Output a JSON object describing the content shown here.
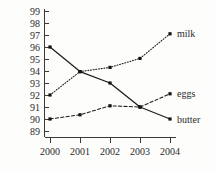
{
  "chart_data": {
    "type": "line",
    "title": "",
    "subtitle": "",
    "xlabel": "",
    "ylabel": "",
    "categories": [
      "2000",
      "2001",
      "2002",
      "2003",
      "2004"
    ],
    "x": [
      2000,
      2001,
      2002,
      2003,
      2004
    ],
    "ylim": [
      88.6,
      99.4
    ],
    "yticks": [
      89,
      90,
      91,
      92,
      93,
      94,
      95,
      96,
      97,
      98,
      99
    ],
    "ytick_labels": [
      "89",
      "90",
      "91",
      "92",
      "93",
      "94",
      "95",
      "96",
      "97",
      "98",
      "99"
    ],
    "xtick_labels": [
      "2000",
      "2001",
      "2002",
      "2003",
      "2004"
    ],
    "grid": false,
    "legend_position": "right-inline-end-of-line",
    "series": [
      {
        "name": "milk",
        "label": "milk",
        "linestyle": "dotted",
        "color": "#1c1c1c",
        "marker": "square",
        "values": [
          92.0,
          93.95,
          94.3,
          95.05,
          97.1
        ]
      },
      {
        "name": "eggs",
        "label": "eggs",
        "linestyle": "dashed",
        "color": "#1c1c1c",
        "marker": "square",
        "values": [
          90.0,
          90.35,
          91.1,
          91.0,
          92.1
        ]
      },
      {
        "name": "butter",
        "label": "butter",
        "linestyle": "solid",
        "color": "#1c1c1c",
        "marker": "square",
        "values": [
          96.0,
          93.95,
          93.0,
          91.0,
          90.0
        ]
      }
    ],
    "annotations": []
  },
  "colors": {
    "background": "#fdfdfc",
    "ink": "#1c1c1c",
    "axis": "#3a3a3a",
    "text": "#2b2b2b"
  }
}
